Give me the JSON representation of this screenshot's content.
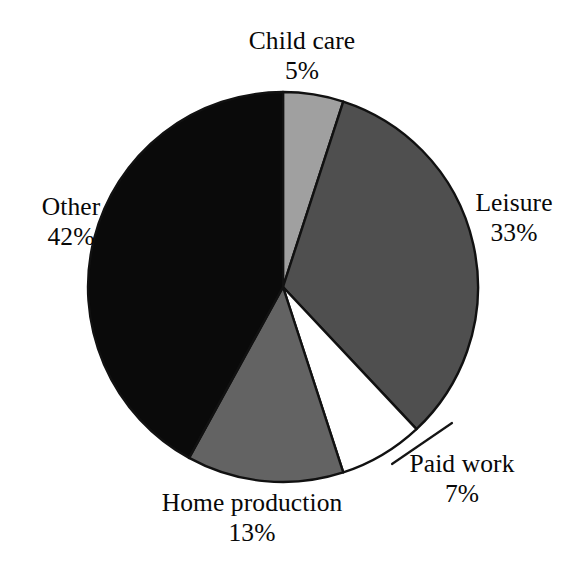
{
  "chart_data": {
    "type": "pie",
    "title": "",
    "subtitle": "",
    "xlabel": "",
    "ylabel": "",
    "legend_position": "none",
    "grid": false,
    "start_angle_deg": 0,
    "direction": "clockwise",
    "unit": "%",
    "categories": [
      "Child care",
      "Leisure",
      "Paid work",
      "Home production",
      "Other"
    ],
    "values": [
      5,
      33,
      7,
      13,
      42
    ],
    "total": 100,
    "slices": [
      {
        "label": "Child care",
        "value": 5,
        "value_label": "5%",
        "color": "#a0a0a0",
        "outline": "#111111",
        "label_position": "top"
      },
      {
        "label": "Leisure",
        "value": 33,
        "value_label": "33%",
        "color": "#4f4f4f",
        "outline": "#111111",
        "label_position": "right"
      },
      {
        "label": "Paid work",
        "value": 7,
        "value_label": "7%",
        "color": "#ffffff",
        "outline": "#111111",
        "label_position": "bottom-right"
      },
      {
        "label": "Home production",
        "value": 13,
        "value_label": "13%",
        "color": "#636363",
        "outline": "#111111",
        "label_position": "bottom"
      },
      {
        "label": "Other",
        "value": 42,
        "value_label": "42%",
        "color": "#0a0a0a",
        "outline": "#111111",
        "label_position": "left"
      }
    ]
  },
  "labels": {
    "child_care": {
      "name": "Child care",
      "value": "5%"
    },
    "leisure": {
      "name": "Leisure",
      "value": "33%"
    },
    "paid_work": {
      "name": "Paid work",
      "value": "7%"
    },
    "home_production": {
      "name": "Home production",
      "value": "13%"
    },
    "other": {
      "name": "Other",
      "value": "42%"
    }
  },
  "geometry": {
    "center_x": 283,
    "center_y": 287,
    "radius": 195
  },
  "colors": {
    "background": "#ffffff",
    "outline": "#111111",
    "text": "#080808"
  }
}
